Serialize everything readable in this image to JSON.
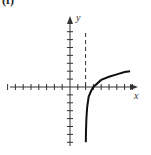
{
  "panel": {
    "label": "(f)"
  },
  "chart_data": {
    "type": "line",
    "title": "",
    "xlabel": "x",
    "ylabel": "y",
    "xlim": [
      -8,
      9
    ],
    "ylim": [
      -8,
      9
    ],
    "x_ticks": [
      -8,
      -7,
      -6,
      -5,
      -4,
      -3,
      -2,
      -1,
      1,
      2,
      3,
      4,
      5,
      6,
      7,
      8
    ],
    "y_ticks": [
      -7,
      -6,
      -5,
      -4,
      -3,
      -2,
      -1,
      1,
      2,
      3,
      4,
      5,
      6,
      7
    ],
    "grid": false,
    "legend": null,
    "tick_labels_shown": false,
    "asymptote": {
      "type": "vertical",
      "x": 2,
      "style": "dashed"
    },
    "series": [
      {
        "name": "logarithmic curve",
        "description": "y = log-type function with vertical asymptote x = 2, crossing x-axis at x = 3",
        "points": [
          [
            2.02,
            -7.0
          ],
          [
            2.05,
            -5.5
          ],
          [
            2.1,
            -4.0
          ],
          [
            2.2,
            -2.5
          ],
          [
            2.4,
            -1.2
          ],
          [
            2.7,
            -0.5
          ],
          [
            3.0,
            0.0
          ],
          [
            4.0,
            0.9
          ],
          [
            5.0,
            1.3
          ],
          [
            6.0,
            1.6
          ],
          [
            7.0,
            1.9
          ],
          [
            7.7,
            2.0
          ]
        ]
      }
    ]
  },
  "axes": {
    "x_label": "x",
    "y_label": "y"
  }
}
